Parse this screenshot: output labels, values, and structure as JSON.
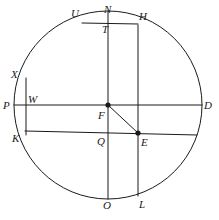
{
  "figure": {
    "kind": "geometry-diagram",
    "width": 219,
    "height": 220,
    "stroke_color": "#1a1a1a",
    "background_color": "#ffffff",
    "fill": "none"
  },
  "circle": {
    "center_x": 108,
    "center_y": 105,
    "radius": 94,
    "center_label": "F"
  },
  "points": [
    {
      "id": "N",
      "label": "N",
      "x": 108,
      "y": 11,
      "label_x": 104,
      "label_y": 4,
      "dot": false
    },
    {
      "id": "U",
      "label": "U",
      "x": 82,
      "y": 23,
      "label_x": 71,
      "label_y": 8,
      "dot": false
    },
    {
      "id": "H",
      "label": "H",
      "x": 138,
      "y": 25,
      "label_x": 139,
      "label_y": 11,
      "dot": false
    },
    {
      "id": "T",
      "label": "T",
      "x": 108,
      "y": 23,
      "label_x": 102,
      "label_y": 24,
      "dot": false
    },
    {
      "id": "X",
      "label": "X",
      "x": 26,
      "y": 80,
      "label_x": 11,
      "label_y": 69,
      "dot": false
    },
    {
      "id": "P",
      "label": "P",
      "x": 14,
      "y": 105,
      "label_x": 3,
      "label_y": 100,
      "dot": false
    },
    {
      "id": "W",
      "label": "W",
      "x": 26,
      "y": 105,
      "label_x": 28,
      "label_y": 94,
      "dot": false
    },
    {
      "id": "F",
      "label": "F",
      "x": 108,
      "y": 105,
      "label_x": 98,
      "label_y": 110,
      "dot": true
    },
    {
      "id": "D",
      "label": "D",
      "x": 202,
      "y": 105,
      "label_x": 204,
      "label_y": 100,
      "dot": false
    },
    {
      "id": "K",
      "label": "K",
      "x": 25,
      "y": 132,
      "label_x": 12,
      "label_y": 133,
      "dot": false
    },
    {
      "id": "Q",
      "label": "Q",
      "x": 108,
      "y": 134,
      "label_x": 97,
      "label_y": 136,
      "dot": false
    },
    {
      "id": "E",
      "label": "E",
      "x": 138,
      "y": 133,
      "label_x": 141,
      "label_y": 137,
      "dot": true
    },
    {
      "id": "O",
      "label": "O",
      "x": 108,
      "y": 199,
      "label_x": 103,
      "label_y": 200,
      "dot": false
    },
    {
      "id": "L",
      "label": "L",
      "x": 138,
      "y": 196,
      "label_x": 139,
      "label_y": 199,
      "dot": false
    }
  ],
  "segments": [
    {
      "id": "NO",
      "name": "vertical-diameter-N-O",
      "x1": 108,
      "y1": 11,
      "x2": 108,
      "y2": 199
    },
    {
      "id": "PD",
      "name": "horizontal-diameter-P-D",
      "x1": 14,
      "y1": 105,
      "x2": 202,
      "y2": 105
    },
    {
      "id": "XK",
      "name": "vertical-chord-X-K",
      "x1": 26,
      "y1": 78,
      "x2": 26,
      "y2": 135
    },
    {
      "id": "HL",
      "name": "vertical-chord-H-L",
      "x1": 138,
      "y1": 25,
      "x2": 138,
      "y2": 196
    },
    {
      "id": "UH",
      "name": "top-chord-U-H",
      "x1": 82,
      "y1": 23,
      "x2": 138,
      "y2": 24
    },
    {
      "id": "KD",
      "name": "lower-chord-K-D",
      "x1": 25,
      "y1": 131,
      "x2": 197,
      "y2": 135
    },
    {
      "id": "FE",
      "name": "radius-segment-F-E",
      "x1": 108,
      "y1": 105,
      "x2": 138,
      "y2": 133
    }
  ],
  "dot_radius": 2.6,
  "stroke_width": 1
}
